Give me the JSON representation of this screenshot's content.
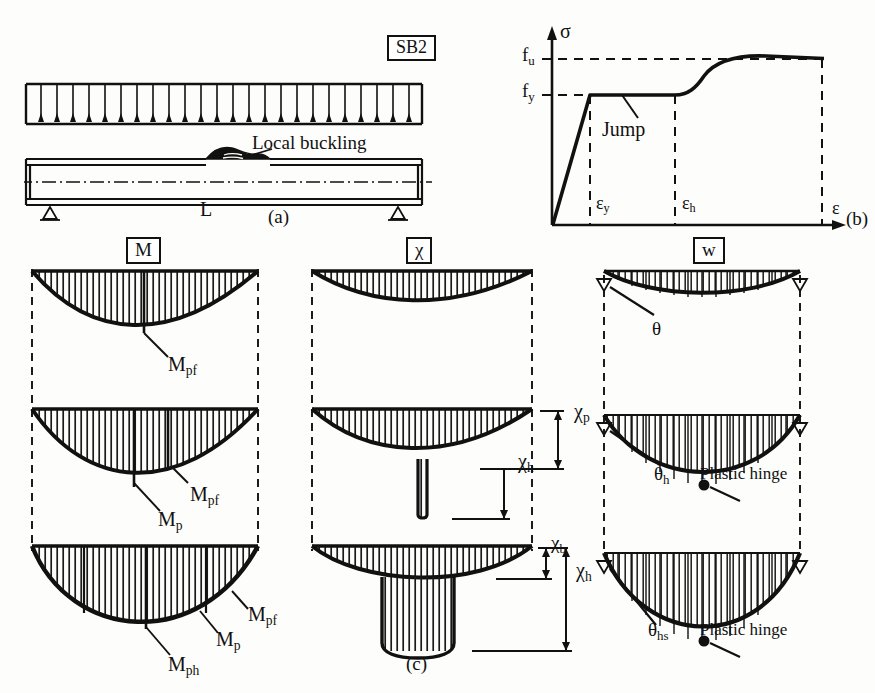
{
  "figure": {
    "panel_a": {
      "specimen_label": "SB2",
      "annotation_local_buckling": "Local buckling",
      "span_label": "L",
      "caption": "(a)",
      "icons": [
        "uniform-load-arrows",
        "roller-support",
        "pin-support",
        "centerline"
      ]
    },
    "panel_b": {
      "caption": "(b)",
      "axis_y": "σ",
      "axis_x": "ε",
      "ticks_y": [
        "f",
        "f"
      ],
      "tick_y_1_main": "f",
      "tick_y_1_sub": "u",
      "tick_y_2_main": "f",
      "tick_y_2_sub": "y",
      "tick_x_1_main": "ε",
      "tick_x_1_sub": "y",
      "tick_x_2_main": "ε",
      "tick_x_2_sub": "h",
      "annotation_jump": "Jump"
    },
    "panel_c": {
      "caption": "(c)",
      "columns": [
        {
          "header": "M",
          "name": "bending-moment"
        },
        {
          "header": "χ",
          "name": "curvature"
        },
        {
          "header": "w",
          "name": "deflection"
        }
      ],
      "moment_labels": {
        "stage1": [
          {
            "main": "M",
            "sub": "pf"
          }
        ],
        "stage2": [
          {
            "main": "M",
            "sub": "pf"
          },
          {
            "main": "M",
            "sub": "p"
          }
        ],
        "stage3": [
          {
            "main": "M",
            "sub": "pf"
          },
          {
            "main": "M",
            "sub": "p"
          },
          {
            "main": "M",
            "sub": "ph"
          }
        ]
      },
      "curvature_labels": {
        "stage2": [
          {
            "main": "χ",
            "sub": "p"
          },
          {
            "main": "χ",
            "sub": "h"
          }
        ],
        "stage3": [
          {
            "main": "χ",
            "sub": "b"
          },
          {
            "main": "χ",
            "sub": "h"
          }
        ]
      },
      "deflection_labels": {
        "stage1": [
          {
            "main": "θ",
            "sub": ""
          }
        ],
        "stage2": [
          {
            "main": "θ",
            "sub": "h"
          }
        ],
        "stage3": [
          {
            "main": "θ",
            "sub": "hs"
          }
        ],
        "hinge_note_stage2": "Plastic hinge",
        "hinge_note_stage3": "Plastic hinge"
      }
    }
  },
  "colors": {
    "ink": "#111111",
    "paper": "#fdfdfb",
    "hatch": "#1a1a1a"
  }
}
